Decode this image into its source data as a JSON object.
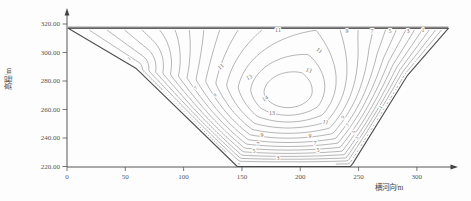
{
  "chart_data": {
    "type": "contour",
    "title": "",
    "xlabel": "横河向/m",
    "ylabel": "高程/m",
    "x_ticks": [
      {
        "label": "0",
        "value": 0
      },
      {
        "label": "50",
        "value": 50
      },
      {
        "label": "100",
        "value": 100
      },
      {
        "label": "150",
        "value": 150
      },
      {
        "label": "200",
        "value": 200
      },
      {
        "label": "250",
        "value": 250
      },
      {
        "label": "300",
        "value": 300
      }
    ],
    "y_ticks": [
      {
        "label": "320.00",
        "value": 320
      },
      {
        "label": "300.00",
        "value": 300
      },
      {
        "label": "280.00",
        "value": 280
      },
      {
        "label": "260.00",
        "value": 260
      },
      {
        "label": "240.00",
        "value": 240
      },
      {
        "label": "220.00",
        "value": 220
      }
    ],
    "xlim": [
      0,
      335
    ],
    "ylim": [
      214,
      322
    ],
    "grid": "off",
    "legend": "none",
    "levels": {
      "min": 1,
      "max": 14,
      "interval": 1
    },
    "labeled_levels": [
      1,
      3,
      5,
      7,
      9,
      11,
      13,
      14
    ],
    "section_outline_m": [
      [
        1,
        317
      ],
      [
        327,
        317
      ],
      [
        292,
        284
      ],
      [
        245,
        222
      ],
      [
        243,
        220
      ],
      [
        146,
        220
      ],
      [
        59,
        289
      ]
    ],
    "peak": {
      "x_m": 190,
      "elevation_m": 272,
      "innermost_contour": 14
    },
    "contour_labels": [
      {
        "v": "11",
        "x": 278,
        "y": 32,
        "r": 0
      },
      {
        "v": "9",
        "x": 347,
        "y": 33,
        "r": 0
      },
      {
        "v": "7",
        "x": 372,
        "y": 33,
        "r": 0
      },
      {
        "v": "5",
        "x": 390,
        "y": 33,
        "r": 0
      },
      {
        "v": "3",
        "x": 408,
        "y": 33,
        "r": 0
      },
      {
        "v": "1",
        "x": 423,
        "y": 32,
        "r": 0
      },
      {
        "v": "11",
        "x": 222,
        "y": 68,
        "r": -42
      },
      {
        "v": "13",
        "x": 250,
        "y": 79,
        "r": -24
      },
      {
        "v": "13",
        "x": 308,
        "y": 72,
        "r": 22
      },
      {
        "v": "11",
        "x": 318,
        "y": 52,
        "r": 36
      },
      {
        "v": "14",
        "x": 266,
        "y": 100,
        "r": -28
      },
      {
        "v": "13",
        "x": 272,
        "y": 115,
        "r": 0
      },
      {
        "v": "9",
        "x": 216,
        "y": 96,
        "r": -48,
        "s": 1
      },
      {
        "v": "7",
        "x": 197,
        "y": 89,
        "r": -48,
        "s": 1
      },
      {
        "v": "1",
        "x": 130,
        "y": 60,
        "r": -32,
        "s": 1
      },
      {
        "v": "9",
        "x": 262,
        "y": 137,
        "r": 0
      },
      {
        "v": "7",
        "x": 258,
        "y": 146,
        "r": 0
      },
      {
        "v": "5",
        "x": 254,
        "y": 153,
        "r": 0
      },
      {
        "v": "3",
        "x": 278,
        "y": 160,
        "r": 0
      },
      {
        "v": "11",
        "x": 325,
        "y": 124,
        "r": 12
      },
      {
        "v": "9",
        "x": 310,
        "y": 138,
        "r": 0
      },
      {
        "v": "7",
        "x": 315,
        "y": 145,
        "r": 0
      },
      {
        "v": "5",
        "x": 318,
        "y": 152,
        "r": 0
      },
      {
        "v": "9",
        "x": 344,
        "y": 118,
        "r": -56,
        "s": 1
      },
      {
        "v": "7",
        "x": 349,
        "y": 126,
        "r": -56,
        "s": 1
      },
      {
        "v": "5",
        "x": 355,
        "y": 133,
        "r": -56,
        "s": 1
      },
      {
        "v": "3",
        "x": 358,
        "y": 139,
        "r": -56,
        "s": 1
      },
      {
        "v": "1",
        "x": 382,
        "y": 108,
        "r": -56,
        "s": 1
      }
    ]
  }
}
